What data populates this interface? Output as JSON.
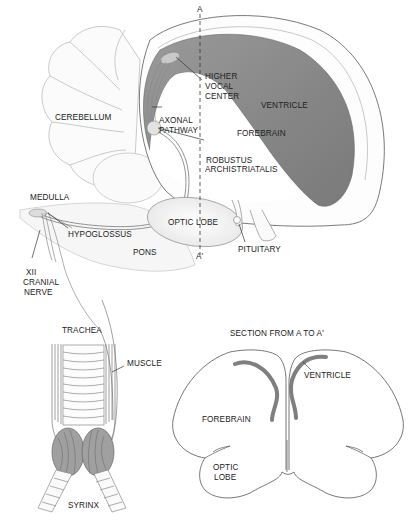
{
  "diagram": {
    "section_marker_top": "A",
    "section_marker_bottom": "A'",
    "brain_labels": {
      "higher_vocal_center": [
        "HIGHER",
        "VOCAL",
        "CENTER"
      ],
      "ventricle": "VENTRICLE",
      "cerebellum": "CEREBELLUM",
      "axonal_pathway": [
        "AXONAL",
        "PATHWAY"
      ],
      "forebrain": "FOREBRAIN",
      "robustus_archistriatalis": [
        "ROBUSTUS",
        "ARCHISTRIATALIS"
      ],
      "medulla": "MEDULLA",
      "optic_lobe": "OPTIC LOBE",
      "hypoglossus": "HYPOGLOSSUS",
      "pituitary": "PITUITARY",
      "pons": "PONS",
      "cranial_nerve": [
        "XII",
        "CRANIAL",
        "NERVE"
      ]
    },
    "syrinx_labels": {
      "trachea": "TRACHEA",
      "muscle": "MUSCLE",
      "syrinx": "SYRINX"
    },
    "section_labels": {
      "title": "SECTION FROM A TO A'",
      "ventricle": "VENTRICLE",
      "forebrain": "FOREBRAIN",
      "optic_lobe": [
        "OPTIC",
        "LOBE"
      ]
    },
    "colors": {
      "ventricle_shade": "#8a8a8a",
      "outline": "#555555",
      "background": "#ffffff"
    }
  }
}
